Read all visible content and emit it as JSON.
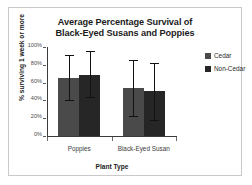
{
  "chart_data": {
    "type": "bar",
    "title": "Average Percentage Survival of Black-Eyed Susans and Poppies",
    "title_line1": "Average Percentage Survival of",
    "title_line2": "Black-Eyed Susans and Poppies",
    "xlabel": "Plant Type",
    "ylabel": "% surviving 1 week or more",
    "categories": [
      "Poppies",
      "Black-Eyed Susan"
    ],
    "ylim": [
      0,
      100
    ],
    "yticks": [
      "0%",
      "20%",
      "40%",
      "60%",
      "80%",
      "100%"
    ],
    "ytick_values": [
      0,
      20,
      40,
      60,
      80,
      100
    ],
    "grid": false,
    "legend_position": "right",
    "series": [
      {
        "name": "Cedar",
        "color": "#4a4a4a",
        "values": [
          65,
          54
        ],
        "error_low": [
          40,
          23
        ],
        "error_high": [
          91,
          85
        ]
      },
      {
        "name": "Non-Cedar",
        "color": "#262626",
        "values": [
          69,
          51
        ],
        "error_low": [
          44,
          18
        ],
        "error_high": [
          95,
          82
        ]
      }
    ]
  },
  "legend": {
    "items": [
      {
        "label": "Cedar",
        "color": "#4a4a4a"
      },
      {
        "label": "Non-Cedar",
        "color": "#262626"
      }
    ]
  }
}
